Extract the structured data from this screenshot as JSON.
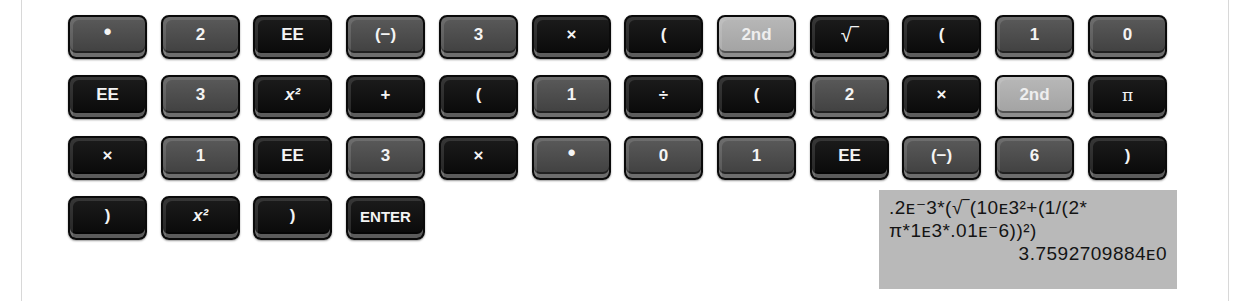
{
  "keypad": {
    "rows": [
      [
        {
          "label": "•",
          "tone": "gray"
        },
        {
          "label": "2",
          "tone": "gray"
        },
        {
          "label": "EE",
          "tone": "black"
        },
        {
          "label": "(−)",
          "tone": "gray"
        },
        {
          "label": "3",
          "tone": "gray"
        },
        {
          "label": "×",
          "tone": "black"
        },
        {
          "label": "(",
          "tone": "black"
        },
        {
          "label": "2nd",
          "tone": "light"
        },
        {
          "label": "√‾",
          "tone": "black"
        },
        {
          "label": "(",
          "tone": "black"
        },
        {
          "label": "1",
          "tone": "gray"
        },
        {
          "label": "0",
          "tone": "gray"
        }
      ],
      [
        {
          "label": "EE",
          "tone": "black"
        },
        {
          "label": "3",
          "tone": "gray"
        },
        {
          "label": "x²",
          "tone": "black"
        },
        {
          "label": "+",
          "tone": "black"
        },
        {
          "label": "(",
          "tone": "black"
        },
        {
          "label": "1",
          "tone": "gray"
        },
        {
          "label": "÷",
          "tone": "black"
        },
        {
          "label": "(",
          "tone": "black"
        },
        {
          "label": "2",
          "tone": "gray"
        },
        {
          "label": "×",
          "tone": "black"
        },
        {
          "label": "2nd",
          "tone": "light"
        },
        {
          "label": "π",
          "tone": "black"
        }
      ],
      [
        {
          "label": "×",
          "tone": "black"
        },
        {
          "label": "1",
          "tone": "gray"
        },
        {
          "label": "EE",
          "tone": "black"
        },
        {
          "label": "3",
          "tone": "gray"
        },
        {
          "label": "×",
          "tone": "black"
        },
        {
          "label": "•",
          "tone": "gray"
        },
        {
          "label": "0",
          "tone": "gray"
        },
        {
          "label": "1",
          "tone": "gray"
        },
        {
          "label": "EE",
          "tone": "black"
        },
        {
          "label": "(−)",
          "tone": "gray"
        },
        {
          "label": "6",
          "tone": "gray"
        },
        {
          "label": ")",
          "tone": "black"
        }
      ],
      [
        {
          "label": ")",
          "tone": "black"
        },
        {
          "label": "x²",
          "tone": "black"
        },
        {
          "label": ")",
          "tone": "black"
        },
        {
          "label": "ENTER",
          "tone": "black"
        }
      ]
    ]
  },
  "display": {
    "line1": ".2ᴇ⁻3*(√‾(10ᴇ3²+(1/(2*",
    "line2": "π*1ᴇ3*.01ᴇ⁻6))²)",
    "result": "3.7592709884ᴇ0"
  }
}
